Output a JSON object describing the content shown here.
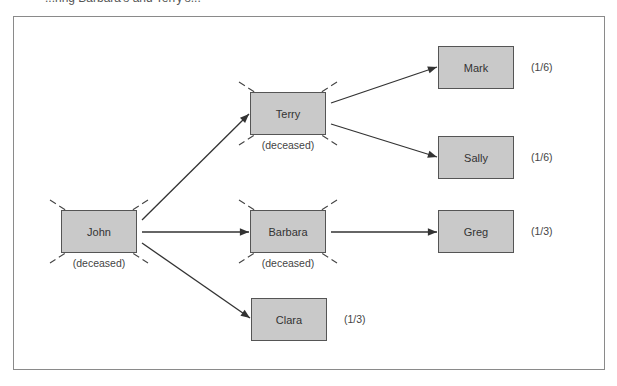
{
  "caption": "...ring Barbara's and Terry's...",
  "diagram": {
    "type": "inheritance-tree",
    "nodes": [
      {
        "id": "john",
        "label": "John",
        "status": "(deceased)",
        "deceased": true,
        "share": ""
      },
      {
        "id": "terry",
        "label": "Terry",
        "status": "(deceased)",
        "deceased": true,
        "share": ""
      },
      {
        "id": "barbara",
        "label": "Barbara",
        "status": "(deceased)",
        "deceased": true,
        "share": ""
      },
      {
        "id": "clara",
        "label": "Clara",
        "status": "",
        "deceased": false,
        "share": "(1/3)"
      },
      {
        "id": "mark",
        "label": "Mark",
        "status": "",
        "deceased": false,
        "share": "(1/6)"
      },
      {
        "id": "sally",
        "label": "Sally",
        "status": "",
        "deceased": false,
        "share": "(1/6)"
      },
      {
        "id": "greg",
        "label": "Greg",
        "status": "",
        "deceased": false,
        "share": "(1/3)"
      }
    ],
    "edges": [
      {
        "from": "john",
        "to": "terry"
      },
      {
        "from": "john",
        "to": "barbara"
      },
      {
        "from": "john",
        "to": "clara"
      },
      {
        "from": "terry",
        "to": "mark"
      },
      {
        "from": "terry",
        "to": "sally"
      },
      {
        "from": "barbara",
        "to": "greg"
      }
    ]
  },
  "colors": {
    "box_fill": "#c9c9c9",
    "box_border": "#555555",
    "line": "#333333"
  }
}
